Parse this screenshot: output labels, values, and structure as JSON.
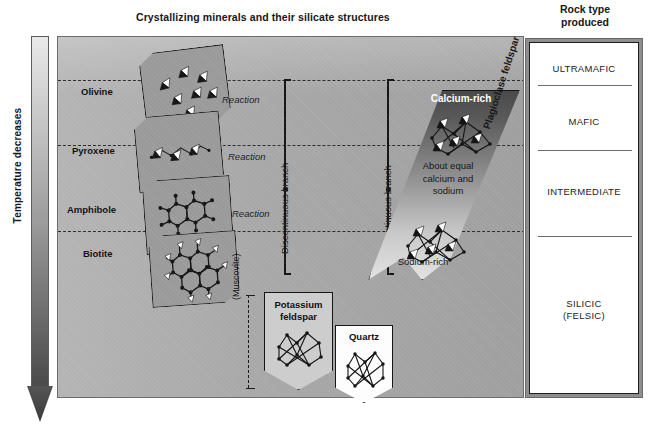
{
  "diagram": {
    "title": "Crystallizing minerals and their silicate structures",
    "rock_type_heading_line1": "Rock type",
    "rock_type_heading_line2": "produced"
  },
  "temperature_axis": {
    "label": "Temperature decreases",
    "direction": "downward",
    "gradient_from": "#e9e9e9",
    "gradient_to": "#4a4a4a"
  },
  "discontinuous_branch": {
    "label": "Discontinuous branch",
    "minerals": [
      {
        "name": "Olivine",
        "structure": "isolated-tetrahedra"
      },
      {
        "name": "Pyroxene",
        "structure": "single-chain"
      },
      {
        "name": "Amphibole",
        "structure": "double-chain"
      },
      {
        "name": "Biotite",
        "structure": "sheet"
      }
    ],
    "reaction_labels": [
      "Reaction",
      "Reaction",
      "Reaction"
    ]
  },
  "continuous_branch": {
    "label": "Continuous branch",
    "series_name": "Plagioclase feldspar",
    "zones": [
      {
        "label": "Calcium-rich"
      },
      {
        "label": "About equal\ncalcium and\nsodium"
      },
      {
        "label": "Sodium-rich"
      }
    ]
  },
  "late_minerals": [
    {
      "name": "(Muscovite)",
      "form": "bracket"
    },
    {
      "name": "Potassium\nfeldspar",
      "form": "pentagon",
      "fill": "#cdcdcd"
    },
    {
      "name": "Quartz",
      "form": "pentagon",
      "fill": "#ffffff"
    }
  ],
  "rock_types": [
    {
      "label": "ULTRAMAFIC"
    },
    {
      "label": "MAFIC"
    },
    {
      "label": "INTERMEDIATE"
    },
    {
      "label": "SILICIC\n(FELSIC)"
    }
  ],
  "colors": {
    "panel_background": "#a8a8a8",
    "mineral_box": "#9a9a9a",
    "outline": "#17171a",
    "dashed_line": "#2b2b2b",
    "rock_panel": "#ffffff"
  }
}
